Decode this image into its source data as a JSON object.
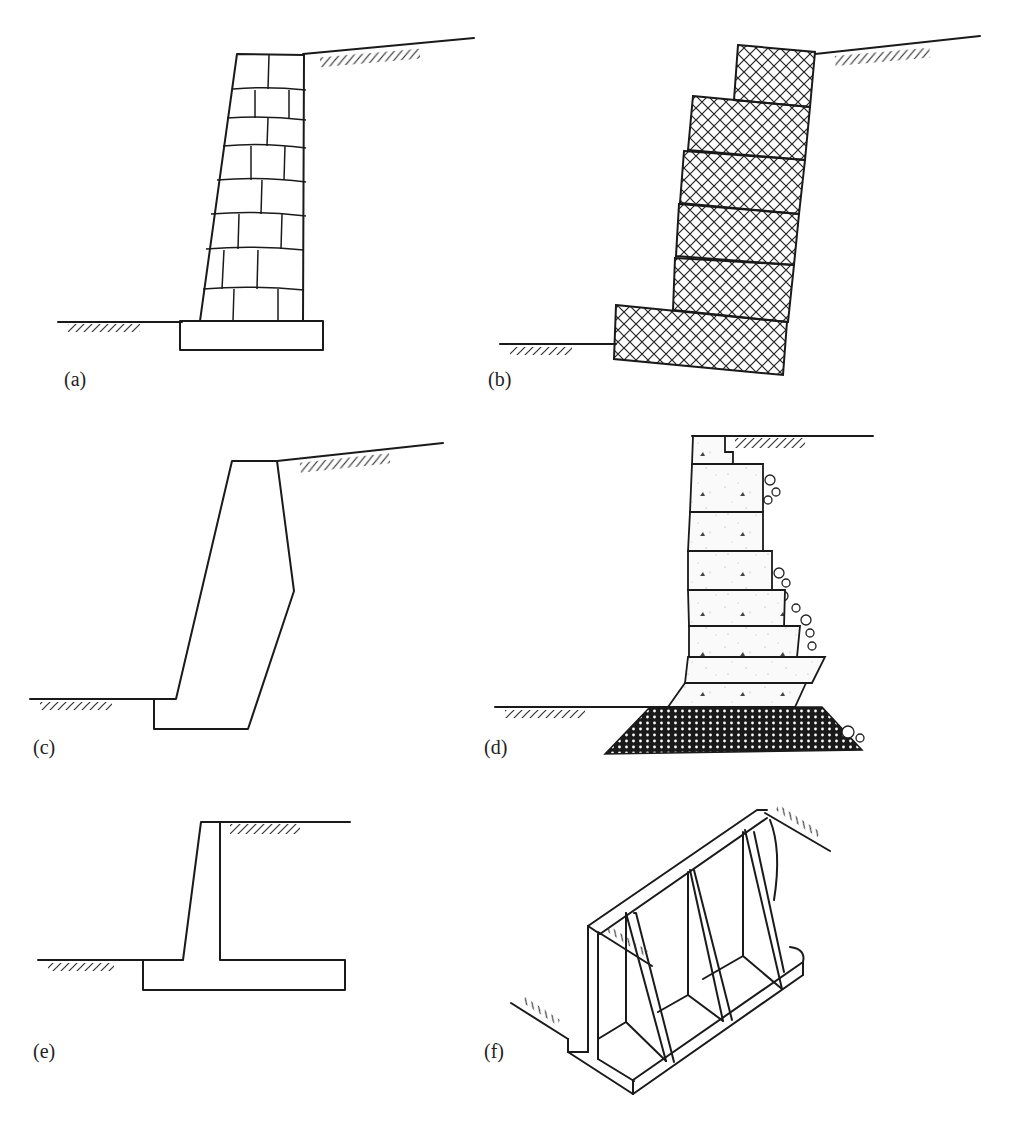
{
  "figure": {
    "panels": [
      {
        "id": "a",
        "label": "(a)",
        "type": "stone-masonry-gravity-wall"
      },
      {
        "id": "b",
        "label": "(b)",
        "type": "gabion-wall"
      },
      {
        "id": "c",
        "label": "(c)",
        "type": "mass-concrete-gravity-wall"
      },
      {
        "id": "d",
        "label": "(d)",
        "type": "crib-block-wall-on-gravel-base"
      },
      {
        "id": "e",
        "label": "(e)",
        "type": "cantilever-t-wall"
      },
      {
        "id": "f",
        "label": "(f)",
        "type": "counterfort-wall"
      }
    ]
  },
  "colors": {
    "line": "#1a1a1a",
    "background": "#ffffff",
    "label": "#222222"
  }
}
